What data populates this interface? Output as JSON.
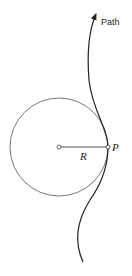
{
  "diagram": {
    "path_label": "Path",
    "radius_label": "R",
    "point_label": "P",
    "colors": {
      "path": "#222222",
      "circle": "#555555",
      "radius": "#444444"
    }
  }
}
